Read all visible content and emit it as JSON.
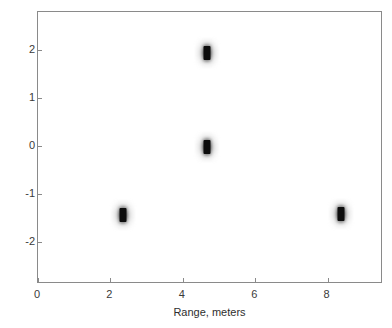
{
  "figure": {
    "kind": "range-doppler-scatter",
    "background_color": "#ffffff",
    "frame_color": "#8a8a8a",
    "marker_color": "#0d0d0d"
  },
  "chart_data": {
    "type": "scatter",
    "title": "",
    "xlabel": "Range, meters",
    "ylabel": "Speed, meters/second",
    "xlim": [
      0,
      9.53
    ],
    "ylim": [
      2.8,
      -2.87
    ],
    "y_axis_inverted": true,
    "xticks": [
      0,
      2,
      4,
      6,
      8
    ],
    "xtick_labels": [
      "0",
      "2",
      "4",
      "6",
      "8"
    ],
    "yticks": [
      -2,
      -1,
      0,
      1,
      2
    ],
    "ytick_labels": [
      "-2",
      "-1",
      "0",
      "1",
      "2"
    ],
    "grid": false,
    "legend": null,
    "points": [
      {
        "label": "target-1",
        "x": 2.35,
        "y": -1.43
      },
      {
        "label": "target-2",
        "x": 4.66,
        "y": -0.02
      },
      {
        "label": "target-3",
        "x": 4.66,
        "y": 1.95
      },
      {
        "label": "target-4",
        "x": 8.37,
        "y": -1.42
      }
    ],
    "values": [
      [
        2.35,
        -1.43
      ],
      [
        4.66,
        -0.02
      ],
      [
        4.66,
        1.95
      ],
      [
        8.37,
        -1.42
      ]
    ]
  }
}
